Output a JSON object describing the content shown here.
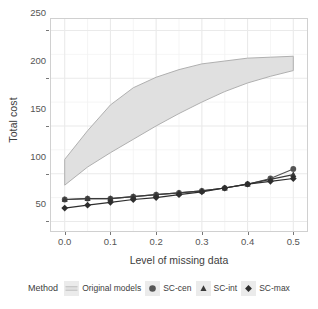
{
  "chart_data": {
    "type": "line",
    "title": "",
    "xlabel": "Level of missing data",
    "ylabel": "Total cost",
    "xlim": [
      -0.03,
      0.53
    ],
    "ylim": [
      40,
      262
    ],
    "xticks": [
      "0.0",
      "0.1",
      "0.2",
      "0.3",
      "0.4",
      "0.5"
    ],
    "xtick_values": [
      0.0,
      0.1,
      0.2,
      0.3,
      0.4,
      0.5
    ],
    "yticks": [
      "50",
      "100",
      "150",
      "200",
      "250"
    ],
    "ytick_values": [
      50,
      100,
      150,
      200,
      250
    ],
    "grid": true,
    "legend_position": "bottom",
    "legend_title": "Method",
    "x": [
      0.0,
      0.05,
      0.1,
      0.15,
      0.2,
      0.25,
      0.3,
      0.35,
      0.4,
      0.45,
      0.5
    ],
    "band": {
      "name": "Original models",
      "type": "area",
      "fill": "#e0e0e0",
      "border": "#b0b0b0",
      "upper": [
        115,
        145,
        172,
        190,
        201,
        209,
        215,
        218,
        221,
        222,
        223
      ],
      "lower": [
        88,
        107,
        122,
        136,
        150,
        163,
        175,
        186,
        195,
        202,
        208
      ]
    },
    "series": [
      {
        "name": "SC-cen",
        "marker": "circle",
        "color": "#555555",
        "values": [
          73,
          74,
          74,
          76,
          78,
          80,
          82,
          85,
          89,
          95,
          105
        ]
      },
      {
        "name": "SC-int",
        "marker": "triangle",
        "color": "#3a3a3a",
        "values": [
          73,
          74,
          74,
          76,
          78,
          80,
          82,
          85,
          89,
          94,
          99
        ]
      },
      {
        "name": "SC-max",
        "marker": "diamond",
        "color": "#2e2e2e",
        "values": [
          64,
          67,
          70,
          73,
          75,
          78,
          81,
          85,
          89,
          92,
          95
        ]
      }
    ]
  },
  "legend": {
    "title": "Method",
    "items": [
      {
        "label": "Original models",
        "marker": "line-swatch"
      },
      {
        "label": "SC-cen",
        "marker": "circle-icon"
      },
      {
        "label": "SC-int",
        "marker": "triangle-icon"
      },
      {
        "label": "SC-max",
        "marker": "diamond-icon"
      }
    ]
  },
  "axes": {
    "y_title": "Total cost",
    "x_title": "Level of missing data",
    "y_labels": [
      "250",
      "200",
      "150",
      "100",
      "50"
    ],
    "x_labels": [
      "0.0",
      "0.1",
      "0.2",
      "0.3",
      "0.4",
      "0.5"
    ]
  }
}
